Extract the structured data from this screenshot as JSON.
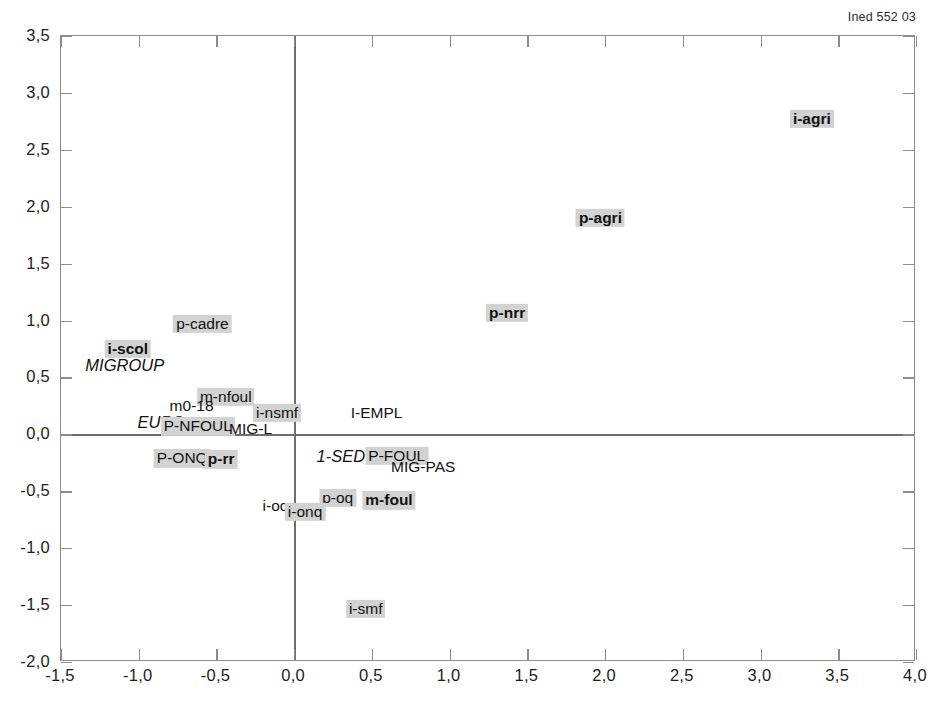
{
  "source_credit": "Ined 552 03",
  "chart_data": {
    "type": "scatter",
    "title": "",
    "subtitle": "",
    "xlabel": "",
    "ylabel": "",
    "xlim": [
      -1.5,
      4.0
    ],
    "ylim": [
      -2.0,
      3.5
    ],
    "xticks": [
      -1.5,
      -1.0,
      -0.5,
      0.0,
      0.5,
      1.0,
      1.5,
      2.0,
      2.5,
      3.0,
      3.5,
      4.0
    ],
    "yticks": [
      -2.0,
      -1.5,
      -1.0,
      -0.5,
      0.0,
      0.5,
      1.0,
      1.5,
      2.0,
      2.5,
      3.0,
      3.5
    ],
    "xtick_labels": [
      "-1,5",
      "-1,0",
      "-0,5",
      "0,0",
      "0,5",
      "1,0",
      "1,5",
      "2,0",
      "2,5",
      "3,0",
      "3,5",
      "4,0"
    ],
    "ytick_labels": [
      "-2,0",
      "-1,5",
      "-1,0",
      "-0,5",
      "0,0",
      "0,5",
      "1,0",
      "1,5",
      "2,0",
      "2,5",
      "3,0",
      "3,5"
    ],
    "grid": false,
    "legend": "none",
    "zero_axes": true,
    "decimal_separator": ",",
    "highlight_color": "#d2d2d2",
    "frame_color": "#8c8c8c",
    "labels_only": true,
    "points": [
      {
        "label": "i-agri",
        "x": 3.33,
        "y": 2.77,
        "style": "bold",
        "highlight": true
      },
      {
        "label": "p-agri",
        "x": 1.97,
        "y": 1.9,
        "style": "bold",
        "highlight": true
      },
      {
        "label": "p-nrr",
        "x": 1.37,
        "y": 1.07,
        "style": "bold",
        "highlight": true
      },
      {
        "label": "p-cadre",
        "x": -0.59,
        "y": 0.97,
        "style": "regular",
        "highlight": true
      },
      {
        "label": "i-scol",
        "x": -1.07,
        "y": 0.75,
        "style": "bold",
        "highlight": true
      },
      {
        "label": "MIGROUP",
        "x": -1.09,
        "y": 0.6,
        "style": "italic",
        "highlight": false
      },
      {
        "label": "m-nfoul",
        "x": -0.44,
        "y": 0.33,
        "style": "regular",
        "highlight": true
      },
      {
        "label": "m0-18",
        "x": -0.66,
        "y": 0.25,
        "style": "regular",
        "highlight": false
      },
      {
        "label": "i-nsmf",
        "x": -0.11,
        "y": 0.19,
        "style": "regular",
        "highlight": true
      },
      {
        "label": "I-EMPL",
        "x": 0.53,
        "y": 0.19,
        "style": "regular",
        "highlight": false
      },
      {
        "label": "EURS",
        "x": -0.86,
        "y": 0.1,
        "style": "italic",
        "highlight": false
      },
      {
        "label": "P-NFOUL",
        "x": -0.62,
        "y": 0.07,
        "style": "regular",
        "highlight": true
      },
      {
        "label": "MIG-L",
        "x": -0.28,
        "y": 0.05,
        "style": "regular",
        "highlight": false
      },
      {
        "label": "P-ONQ",
        "x": -0.72,
        "y": -0.21,
        "style": "regular",
        "highlight": true
      },
      {
        "label": "p-rr",
        "x": -0.47,
        "y": -0.22,
        "style": "bold",
        "highlight": true
      },
      {
        "label": "1-SED",
        "x": 0.3,
        "y": -0.2,
        "style": "italic",
        "highlight": false
      },
      {
        "label": "P-FOUL",
        "x": 0.66,
        "y": -0.19,
        "style": "regular",
        "highlight": true
      },
      {
        "label": "MIG-PAS",
        "x": 0.83,
        "y": -0.29,
        "style": "regular",
        "highlight": false
      },
      {
        "label": "p-oq",
        "x": 0.28,
        "y": -0.56,
        "style": "regular",
        "highlight": true
      },
      {
        "label": "m-foul",
        "x": 0.61,
        "y": -0.58,
        "style": "bold",
        "highlight": true
      },
      {
        "label": "i-oq",
        "x": -0.12,
        "y": -0.63,
        "style": "regular",
        "highlight": false
      },
      {
        "label": "i-onq",
        "x": 0.07,
        "y": -0.68,
        "style": "regular",
        "highlight": true
      },
      {
        "label": "i-smf",
        "x": 0.46,
        "y": -1.53,
        "style": "regular",
        "highlight": true
      }
    ]
  }
}
